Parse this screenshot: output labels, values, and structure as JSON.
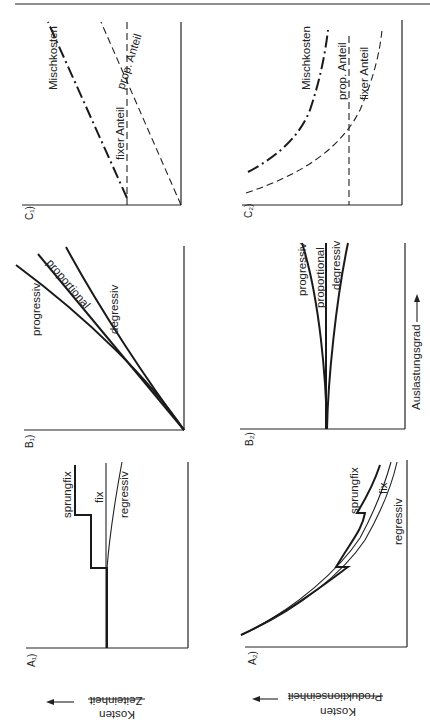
{
  "figure": {
    "orientation": "rotated-90-clockwise",
    "y_axis_label_top": "Kosten",
    "y_axis_label_a1_bottom": "Zeiteinheit",
    "y_axis_label_a2_bottom": "Produktionseinheit",
    "x_axis_label": "Auslastungsgrad"
  },
  "panels": {
    "A1": {
      "tag": "A₁)",
      "labels": [
        "sprungfix",
        "fix",
        "regressiv"
      ]
    },
    "B1": {
      "tag": "B₁)",
      "labels": [
        "progressiv",
        "proportional",
        "degressiv"
      ]
    },
    "C1": {
      "tag": "C₁)",
      "labels": [
        "Mischkosten",
        "fixer Anteil",
        "prop. Anteil"
      ]
    },
    "A2": {
      "tag": "A₂)",
      "labels": [
        "sprungfix",
        "fix",
        "regressiv"
      ]
    },
    "B2": {
      "tag": "B₂)",
      "labels": [
        "progressiv",
        "proportional",
        "degressiv"
      ]
    },
    "C2": {
      "tag": "C₂)",
      "labels": [
        "Mischkosten",
        "prop. Anteil",
        "fixer Anteil"
      ]
    }
  }
}
